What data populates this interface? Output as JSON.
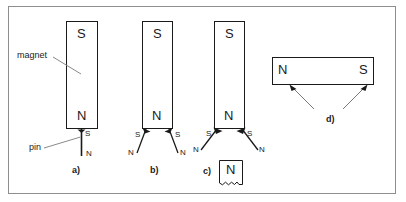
{
  "figure": {
    "border_color": "#8e8e8e",
    "ink_color": "#1a1a1a",
    "background": "#ffffff"
  },
  "annotations": {
    "magnet_label": "magnet",
    "pin_label": "pin"
  },
  "panels": [
    {
      "key": "a",
      "caption": "a)",
      "magnet": {
        "top_pole": "S",
        "bottom_pole": "N",
        "orientation": "vertical"
      },
      "pins": [
        {
          "near_pole": "S",
          "far_pole": "N"
        }
      ]
    },
    {
      "key": "b",
      "caption": "b)",
      "magnet": {
        "top_pole": "S",
        "bottom_pole": "N",
        "orientation": "vertical"
      },
      "pins": [
        {
          "near_pole": "S",
          "far_pole": "N"
        },
        {
          "near_pole": "S",
          "far_pole": "N"
        }
      ]
    },
    {
      "key": "c",
      "caption": "c)",
      "magnet": {
        "top_pole": "S",
        "bottom_pole": "N",
        "orientation": "vertical"
      },
      "pins": [
        {
          "near_pole": "S",
          "far_pole": "N"
        },
        {
          "near_pole": "S",
          "far_pole": "N"
        }
      ],
      "fragment": {
        "pole": "N",
        "edge": "broken"
      }
    },
    {
      "key": "d",
      "caption": "d)",
      "magnet": {
        "left_pole": "N",
        "right_pole": "S",
        "orientation": "horizontal"
      },
      "arrows": 2
    }
  ]
}
